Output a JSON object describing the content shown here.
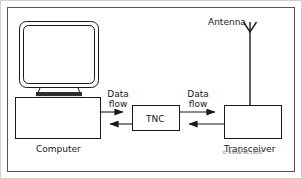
{
  "figure": {
    "credit": "© RSGB RC1620",
    "credit_symbol": "©",
    "credit_text": "RSGB RC1620"
  },
  "nodes": {
    "computer": {
      "label": "Computer",
      "icon": "crt-monitor-icon"
    },
    "tnc": {
      "label": "TNC"
    },
    "transceiver": {
      "label": "Transceiver"
    },
    "antenna": {
      "label": "Antenna",
      "icon": "antenna-icon"
    }
  },
  "connections": [
    {
      "name": "computer-to-tnc",
      "label": "Data\nflow",
      "label_line1": "Data",
      "label_line2": "flow",
      "direction": "right"
    },
    {
      "name": "tnc-to-computer",
      "direction": "left"
    },
    {
      "name": "tnc-to-transceiver",
      "label_line1": "Data",
      "label_line2": "flow",
      "direction": "right"
    },
    {
      "name": "transceiver-to-tnc",
      "direction": "left"
    },
    {
      "name": "transceiver-to-antenna",
      "direction": "none"
    }
  ],
  "style": {
    "line_color": "#1a1a1a",
    "frame_color": "#555555",
    "outer_frame_color": "#cfcfcf",
    "background": "#ffffff",
    "credit_color": "#6a6a6a"
  }
}
